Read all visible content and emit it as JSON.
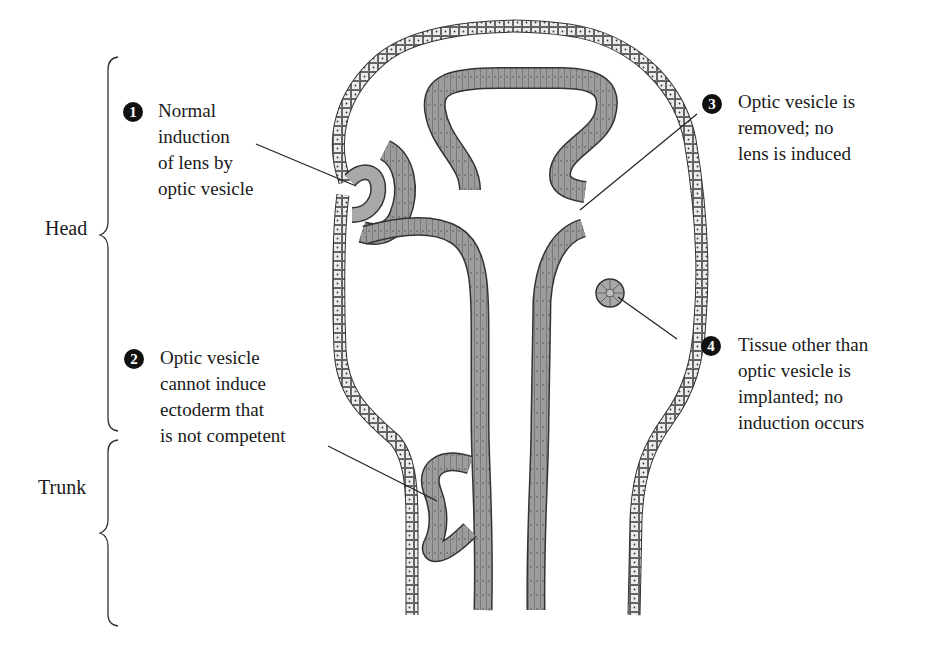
{
  "regions": {
    "head": "Head",
    "trunk": "Trunk"
  },
  "annotations": [
    {
      "number": "1",
      "lines": [
        "Normal",
        "induction",
        "of lens by",
        "optic vesicle"
      ]
    },
    {
      "number": "2",
      "lines": [
        "Optic vesicle",
        "cannot induce",
        "ectoderm that",
        "is not competent"
      ]
    },
    {
      "number": "3",
      "lines": [
        "Optic vesicle is",
        "removed; no",
        "lens is induced"
      ]
    },
    {
      "number": "4",
      "lines": [
        "Tissue other than",
        "optic vesicle is",
        "implanted; no",
        "induction occurs"
      ]
    }
  ],
  "colors": {
    "ectoderm_fill": "#e8e8e8",
    "neural_fill": "#9a9a9a",
    "outline": "#333333",
    "text": "#1a1a1a"
  }
}
